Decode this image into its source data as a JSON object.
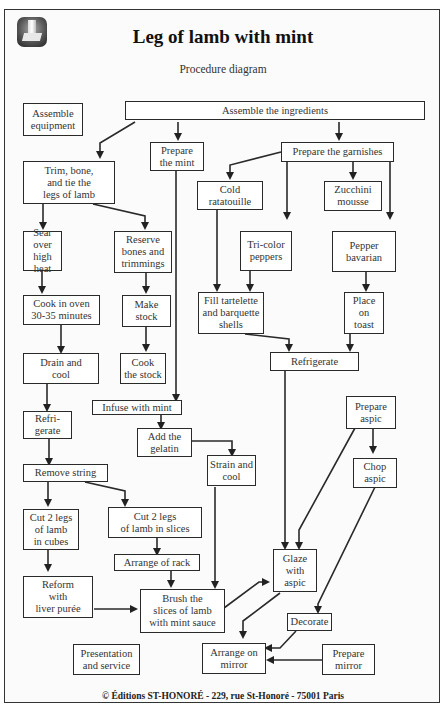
{
  "header": {
    "title": "Leg of lamb with mint",
    "subtitle": "Procedure diagram",
    "logo_icon": "chef-toque-icon"
  },
  "footer": {
    "copyright": "© Éditions ST-HONORÉ - 229, rue St-Honoré - 75001 Paris"
  },
  "nodes": {
    "assemble_equipment": "Assemble\nequipment",
    "assemble_ingredients": "Assemble the ingredients",
    "trim_bone_tie": "Trim, bone,\nand tie the\nlegs of lamb",
    "prepare_mint": "Prepare\nthe mint",
    "prepare_garnishes": "Prepare the garnishes",
    "cold_ratatouille": "Cold\nratatouille",
    "zucchini_mousse": "Zucchini\nmousse",
    "tricolor_peppers": "Tri-color\npeppers",
    "pepper_bavarian": "Pepper\nbavarian",
    "sear": "Sear\nover high\nheat",
    "reserve_bones": "Reserve\nbones and\ntrimmings",
    "fill_shells": "Fill tartelette\nand barquette\nshells",
    "place_on_toast": "Place\non\ntoast",
    "cook_oven": "Cook in oven\n30-35 minutes",
    "make_stock": "Make\nstock",
    "refrigerate_garnish": "Refrigerate",
    "drain_cool": "Drain and\ncool",
    "cook_stock": "Cook\nthe stock",
    "infuse_mint": "Infuse with mint",
    "refrigerate_lamb": "Refri-\ngerate",
    "prepare_aspic": "Prepare\naspic",
    "add_gelatin": "Add the\ngelatin",
    "strain_cool": "Strain and\ncool",
    "chop_aspic": "Chop\naspic",
    "remove_string": "Remove string",
    "cut_cubes": "Cut 2 legs\nof lamb\nin cubes",
    "cut_slices": "Cut 2 legs\nof lamb in slices",
    "arrange_rack": "Arrange of rack",
    "glaze_aspic": "Glaze\nwith\naspic",
    "reform_liver": "Reform\nwith\nliver purée",
    "brush_slices": "Brush the\nslices of lamb\nwith mint sauce",
    "decorate": "Decorate",
    "presentation": "Presentation\nand service",
    "arrange_mirror": "Arrange on\nmirror",
    "prepare_mirror": "Prepare\nmirror"
  },
  "edges": [
    [
      "assemble_ingredients",
      "trim_bone_tie"
    ],
    [
      "assemble_ingredients",
      "prepare_mint"
    ],
    [
      "assemble_ingredients",
      "prepare_garnishes"
    ],
    [
      "prepare_garnishes",
      "cold_ratatouille"
    ],
    [
      "prepare_garnishes",
      "tricolor_peppers"
    ],
    [
      "prepare_garnishes",
      "zucchini_mousse"
    ],
    [
      "prepare_garnishes",
      "pepper_bavarian"
    ],
    [
      "trim_bone_tie",
      "sear"
    ],
    [
      "trim_bone_tie",
      "reserve_bones"
    ],
    [
      "sear",
      "cook_oven"
    ],
    [
      "cook_oven",
      "drain_cool"
    ],
    [
      "drain_cool",
      "refrigerate_lamb"
    ],
    [
      "refrigerate_lamb",
      "remove_string"
    ],
    [
      "reserve_bones",
      "make_stock"
    ],
    [
      "make_stock",
      "cook_stock"
    ],
    [
      "prepare_mint",
      "infuse_mint"
    ],
    [
      "infuse_mint",
      "add_gelatin"
    ],
    [
      "add_gelatin",
      "strain_cool"
    ],
    [
      "cold_ratatouille",
      "fill_shells"
    ],
    [
      "tricolor_peppers",
      "fill_shells"
    ],
    [
      "pepper_bavarian",
      "place_on_toast"
    ],
    [
      "fill_shells",
      "refrigerate_garnish"
    ],
    [
      "place_on_toast",
      "refrigerate_garnish"
    ],
    [
      "refrigerate_garnish",
      "glaze_aspic"
    ],
    [
      "prepare_aspic",
      "glaze_aspic"
    ],
    [
      "prepare_aspic",
      "chop_aspic"
    ],
    [
      "chop_aspic",
      "decorate"
    ],
    [
      "remove_string",
      "cut_cubes"
    ],
    [
      "remove_string",
      "cut_slices"
    ],
    [
      "cut_slices",
      "arrange_rack"
    ],
    [
      "arrange_rack",
      "brush_slices"
    ],
    [
      "cut_cubes",
      "reform_liver"
    ],
    [
      "reform_liver",
      "brush_slices"
    ],
    [
      "strain_cool",
      "brush_slices"
    ],
    [
      "brush_slices",
      "glaze_aspic"
    ],
    [
      "glaze_aspic",
      "arrange_mirror"
    ],
    [
      "decorate",
      "arrange_mirror"
    ],
    [
      "prepare_mirror",
      "arrange_mirror"
    ]
  ]
}
